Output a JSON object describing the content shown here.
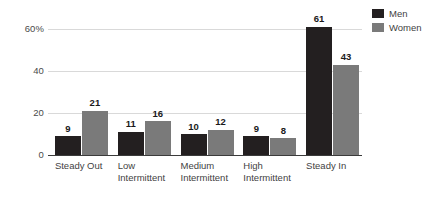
{
  "chart_data": {
    "type": "bar",
    "title": "",
    "subtitle": "",
    "xlabel": "",
    "ylabel": "",
    "ylim": [
      0,
      60
    ],
    "yticks": [
      "0",
      "20",
      "40",
      "60%"
    ],
    "ytick_values": [
      0,
      20,
      40,
      60
    ],
    "grid": "horizontal",
    "legend_position": "top-right",
    "categories": [
      "Steady Out",
      "Low\nIntermittent",
      "Medium\nIntermittent",
      "High\nIntermittent",
      "Steady In"
    ],
    "series": [
      {
        "name": "Men",
        "color": "#231f20",
        "values": [
          9,
          11,
          10,
          9,
          61
        ]
      },
      {
        "name": "Women",
        "color": "#7a7a7a",
        "values": [
          21,
          16,
          12,
          8,
          43
        ]
      }
    ]
  },
  "legend": {
    "items": [
      {
        "label": "Men",
        "color": "#231f20"
      },
      {
        "label": "Women",
        "color": "#7a7a7a"
      }
    ]
  },
  "axis": {
    "y_ticks": [
      {
        "label": "60%",
        "value": 60
      },
      {
        "label": "40",
        "value": 40
      },
      {
        "label": "20",
        "value": 20
      },
      {
        "label": "0",
        "value": 0
      }
    ]
  },
  "colors": {
    "men": "#231f20",
    "women": "#7a7a7a",
    "gridline": "#d9d9d9",
    "axis": "#3b3b3b",
    "text": "#3f3f3f",
    "background": "#ffffff"
  }
}
